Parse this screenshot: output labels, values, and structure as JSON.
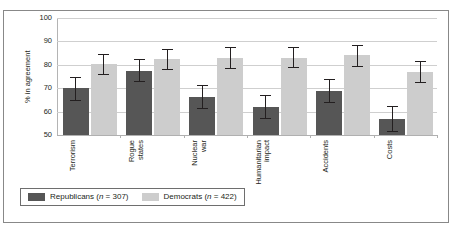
{
  "figure": {
    "clipped_title": "",
    "frame_border_color": "#888888"
  },
  "chart_data": {
    "type": "bar",
    "title": "",
    "subtitle": "",
    "xlabel": "",
    "ylabel": "% in agreement",
    "ylim": [
      50,
      100
    ],
    "yticks": [
      50,
      60,
      70,
      80,
      90,
      100
    ],
    "ytick_labels": [
      "50",
      "60",
      "70",
      "80",
      "90",
      "100"
    ],
    "grid": true,
    "grid_axis": "y",
    "legend_position": "bottom-left",
    "error_bars": "95% CI",
    "categories": [
      "Terrorism",
      "Rogue states",
      "Nuclear war",
      "Humanitarian impact",
      "Accidents",
      "Costs"
    ],
    "category_label_lines": [
      [
        "Terrorism"
      ],
      [
        "Rogue",
        "states"
      ],
      [
        "Nuclear",
        "war"
      ],
      [
        "Humanitarian",
        "impact"
      ],
      [
        "Accidents"
      ],
      [
        "Costs"
      ]
    ],
    "series": [
      {
        "name": "Republicans (n = 307)",
        "legend_label_text": "Republicans (",
        "legend_label_italic": "n",
        "legend_label_tail": " = 307)",
        "n": 307,
        "color": "#565656",
        "values": [
          70.0,
          77.5,
          66.2,
          62.0,
          68.6,
          57.0
        ],
        "err_low": [
          65.0,
          72.9,
          61.4,
          57.2,
          63.9,
          51.8
        ],
        "err_high": [
          74.6,
          82.3,
          71.4,
          67.0,
          74.0,
          62.4
        ]
      },
      {
        "name": "Democrats (n = 422)",
        "legend_label_text": "Democrats (",
        "legend_label_italic": "n",
        "legend_label_tail": " = 422)",
        "n": 422,
        "color": "#cdcdcd",
        "values": [
          80.2,
          82.5,
          82.8,
          83.1,
          84.0,
          77.1
        ],
        "err_low": [
          76.2,
          78.4,
          78.5,
          78.9,
          79.6,
          72.6
        ],
        "err_high": [
          84.6,
          86.6,
          87.6,
          87.7,
          88.6,
          81.5
        ]
      }
    ]
  },
  "legend": {
    "entries": [
      {
        "swatch": "rep",
        "prefix": "Republicans (",
        "italic": "n",
        "suffix": " = 307)"
      },
      {
        "swatch": "dem",
        "prefix": "Democrats (",
        "italic": "n",
        "suffix": " = 422)"
      }
    ]
  }
}
